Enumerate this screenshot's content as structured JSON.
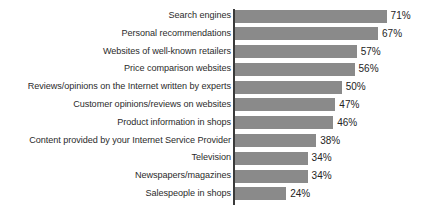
{
  "chart_data": {
    "type": "bar",
    "orientation": "horizontal",
    "title": "",
    "subtitle": "",
    "xlabel": "",
    "ylabel": "",
    "xlim": [
      0,
      71
    ],
    "grid": false,
    "legend": false,
    "value_suffix": "%",
    "bar_color": "#8a8a8a",
    "axis_color": "#3a3a3a",
    "background_color": "#ffffff",
    "categories": [
      "Search engines",
      "Personal recommendations",
      "Websites of well-known retailers",
      "Price comparison websites",
      "Reviews/opinions on the Internet written by experts",
      "Customer opinions/reviews on websites",
      "Product information in shops",
      "Content provided by your Internet Service Provider",
      "Television",
      "Newspapers/magazines",
      "Salespeople in shops"
    ],
    "values": [
      71,
      67,
      57,
      56,
      50,
      47,
      46,
      38,
      34,
      34,
      24
    ],
    "value_labels": [
      "71%",
      "67%",
      "57%",
      "56%",
      "50%",
      "47%",
      "46%",
      "38%",
      "34%",
      "34%",
      "24%"
    ]
  }
}
